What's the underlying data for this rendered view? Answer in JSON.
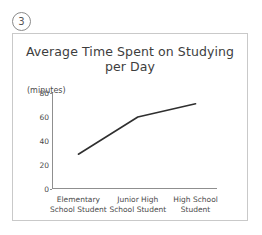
{
  "figure": {
    "number": "3"
  },
  "chart_data": {
    "type": "line",
    "title": "Average Time Spent on Studying",
    "title_line2": "per Day",
    "ylabel": "(minutes)",
    "xlabel": "",
    "categories": [
      "Elementary School Student",
      "Junior High School Student",
      "High School Student"
    ],
    "category_lines": [
      [
        "Elementary",
        "School Student"
      ],
      [
        "Junior High",
        "School Student"
      ],
      [
        "High School",
        "Student"
      ]
    ],
    "values": [
      29,
      60,
      71
    ],
    "ylim": [
      0,
      80
    ],
    "yticks": [
      80,
      60,
      40,
      20,
      0
    ],
    "ytick_labels": [
      "80",
      "60",
      "40",
      "20",
      "0"
    ],
    "grid": false,
    "legend": false,
    "line_color": "#2f2f2f",
    "axis_color": "#8f8f8f",
    "border_color": "#c9c9c9"
  }
}
